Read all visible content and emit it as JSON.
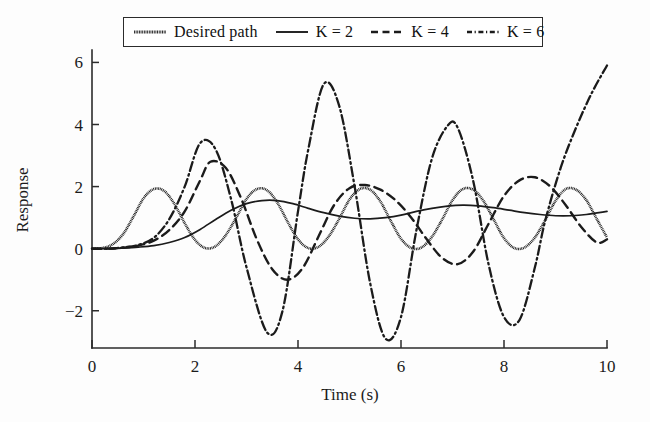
{
  "chart_data": {
    "type": "line",
    "title": "",
    "xlabel": "Time (s)",
    "ylabel": "Response",
    "xlim": [
      0,
      10
    ],
    "ylim": [
      -3.2,
      6.4
    ],
    "xticks": [
      0,
      2,
      4,
      6,
      8,
      10
    ],
    "yticks": [
      -2,
      0,
      2,
      4,
      6
    ],
    "xtick_labels": [
      "0",
      "2",
      "4",
      "6",
      "8",
      "10"
    ],
    "ytick_labels": [
      "−2",
      "0",
      "2",
      "4",
      "6"
    ],
    "grid": false,
    "legend_position": "top-center",
    "series": [
      {
        "name": "Desired path",
        "style": "fine-dotted",
        "x": [
          0.0,
          0.2,
          0.4,
          0.6,
          0.8,
          1.0,
          1.2,
          1.4,
          1.6,
          1.8,
          2.0,
          2.2,
          2.4,
          2.6,
          2.8,
          3.0,
          3.2,
          3.4,
          3.6,
          3.8,
          4.0,
          4.2,
          4.4,
          4.6,
          4.8,
          5.0,
          5.2,
          5.4,
          5.6,
          5.8,
          6.0,
          6.2,
          6.4,
          6.6,
          6.8,
          7.0,
          7.2,
          7.4,
          7.6,
          7.8,
          8.0,
          8.2,
          8.4,
          8.6,
          8.8,
          9.0,
          9.2,
          9.4,
          9.6,
          9.8,
          10.0
        ],
        "y": [
          0.0,
          0.02,
          0.14,
          0.46,
          1.02,
          1.62,
          1.92,
          1.86,
          1.44,
          0.82,
          0.28,
          0.02,
          0.08,
          0.44,
          1.0,
          1.6,
          1.92,
          1.88,
          1.48,
          0.86,
          0.3,
          0.02,
          0.06,
          0.4,
          0.96,
          1.58,
          1.92,
          1.9,
          1.52,
          0.9,
          0.32,
          0.02,
          0.04,
          0.38,
          0.94,
          1.56,
          1.92,
          1.9,
          1.54,
          0.94,
          0.34,
          0.02,
          0.04,
          0.36,
          0.92,
          1.54,
          1.92,
          1.9,
          1.56,
          0.96,
          0.36
        ]
      },
      {
        "name": "K = 2",
        "style": "solid",
        "x": [
          0.0,
          0.3,
          0.6,
          0.9,
          1.2,
          1.5,
          1.8,
          2.1,
          2.4,
          2.7,
          3.0,
          3.3,
          3.6,
          3.9,
          4.2,
          4.5,
          4.8,
          5.1,
          5.4,
          5.7,
          6.0,
          6.3,
          6.6,
          6.9,
          7.2,
          7.5,
          7.8,
          8.1,
          8.4,
          8.7,
          9.0,
          9.3,
          9.6,
          10.0
        ],
        "y": [
          0.0,
          0.0,
          0.02,
          0.05,
          0.1,
          0.2,
          0.36,
          0.62,
          0.94,
          1.24,
          1.45,
          1.55,
          1.55,
          1.45,
          1.3,
          1.16,
          1.05,
          0.98,
          0.96,
          1.0,
          1.08,
          1.2,
          1.3,
          1.37,
          1.4,
          1.38,
          1.32,
          1.24,
          1.16,
          1.1,
          1.06,
          1.06,
          1.1,
          1.2
        ]
      },
      {
        "name": "K = 4",
        "style": "dashed",
        "x": [
          0.0,
          0.3,
          0.6,
          0.9,
          1.2,
          1.5,
          1.8,
          2.1,
          2.3,
          2.6,
          2.9,
          3.2,
          3.5,
          3.8,
          4.1,
          4.4,
          4.7,
          5.0,
          5.3,
          5.6,
          5.9,
          6.2,
          6.5,
          6.8,
          7.1,
          7.4,
          7.7,
          8.0,
          8.3,
          8.6,
          8.9,
          9.2,
          9.5,
          9.8,
          10.0
        ],
        "y": [
          0.0,
          0.0,
          0.03,
          0.1,
          0.26,
          0.6,
          1.2,
          2.2,
          2.8,
          2.6,
          1.6,
          0.3,
          -0.66,
          -1.0,
          -0.6,
          0.4,
          1.4,
          1.95,
          2.05,
          1.9,
          1.55,
          1.0,
          0.3,
          -0.3,
          -0.5,
          -0.1,
          0.8,
          1.7,
          2.2,
          2.3,
          2.0,
          1.4,
          0.7,
          0.2,
          0.3
        ]
      },
      {
        "name": "K = 6",
        "style": "dash-dot",
        "x": [
          0.0,
          0.3,
          0.6,
          0.9,
          1.2,
          1.5,
          1.8,
          2.1,
          2.4,
          2.7,
          3.0,
          3.4,
          3.7,
          4.0,
          4.2,
          4.5,
          4.8,
          5.1,
          5.4,
          5.7,
          6.0,
          6.3,
          6.6,
          6.9,
          7.1,
          7.4,
          7.7,
          8.0,
          8.3,
          8.6,
          8.8,
          9.1,
          9.4,
          9.7,
          10.0
        ],
        "y": [
          0.0,
          0.0,
          0.04,
          0.12,
          0.35,
          0.95,
          2.0,
          3.4,
          3.2,
          1.6,
          -0.6,
          -2.7,
          -2.0,
          1.2,
          3.2,
          5.3,
          4.6,
          2.0,
          -1.1,
          -2.9,
          -2.2,
          0.6,
          2.9,
          3.95,
          3.9,
          2.2,
          -0.5,
          -2.2,
          -2.3,
          -0.6,
          0.9,
          2.6,
          3.9,
          5.0,
          5.9
        ]
      }
    ]
  },
  "legend": {
    "items": [
      {
        "label": "Desired path",
        "style": "fine-dotted",
        "italic_prefix": ""
      },
      {
        "label": "K = 2",
        "style": "solid",
        "italic_prefix": "K"
      },
      {
        "label": "K = 4",
        "style": "dashed",
        "italic_prefix": ""
      },
      {
        "label": "K = 6",
        "style": "dash-dot",
        "italic_prefix": ""
      }
    ]
  },
  "axes": {
    "x_title": "Time (s)",
    "y_title": "Response"
  },
  "colors": {
    "foreground": "#1b1b1b",
    "background": "#ffffff"
  }
}
